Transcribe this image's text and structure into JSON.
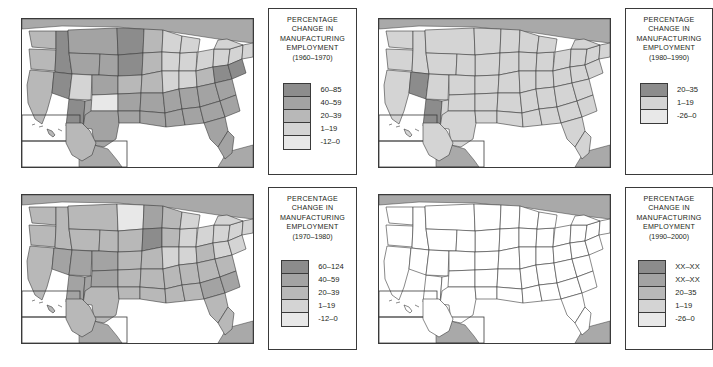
{
  "figure": {
    "caption": "",
    "panel_count": 4
  },
  "palette": {
    "ink": "#3a3a3a",
    "text": "#231f20",
    "background": "#ffffff",
    "canada_mexico_fill": "#a9a9a9",
    "water_fill": "#ffffff",
    "tone_1_darkest": "#8c8c8c",
    "tone_2": "#a3a3a3",
    "tone_3": "#b8b8b8",
    "tone_4": "#d4d4d4",
    "tone_5_lightest": "#e8e8e8",
    "unfilled": "#ffffff"
  },
  "legend_common": {
    "line1": "PERCENTAGE",
    "line2": "CHANGE IN",
    "line3": "MANUFACTURING",
    "line4": "EMPLOYMENT"
  },
  "panels": [
    {
      "id": "panel-1960-1970",
      "position": "top-left",
      "period": "(1960–1970)",
      "legend": {
        "classes": [
          {
            "label": "60–85",
            "color": "#8c8c8c"
          },
          {
            "label": "40–59",
            "color": "#a3a3a3"
          },
          {
            "label": "20–39",
            "color": "#b8b8b8"
          },
          {
            "label": "1–19",
            "color": "#d4d4d4"
          },
          {
            "label": "-12–0",
            "color": "#e8e8e8"
          }
        ]
      }
    },
    {
      "id": "panel-1980-1990",
      "position": "top-right",
      "period": "(1980–1990)",
      "legend": {
        "classes": [
          {
            "label": "20–35",
            "color": "#8c8c8c"
          },
          {
            "label": "1–19",
            "color": "#d4d4d4"
          },
          {
            "label": "-26–0",
            "color": "#e8e8e8"
          }
        ]
      }
    },
    {
      "id": "panel-1970-1980",
      "position": "bottom-left",
      "period": "(1970–1980)",
      "legend": {
        "classes": [
          {
            "label": "60–124",
            "color": "#8c8c8c"
          },
          {
            "label": "40–59",
            "color": "#a3a3a3"
          },
          {
            "label": "20–39",
            "color": "#b8b8b8"
          },
          {
            "label": "1–19",
            "color": "#d4d4d4"
          },
          {
            "label": "-12–0",
            "color": "#e8e8e8"
          }
        ]
      }
    },
    {
      "id": "panel-1990-2000",
      "position": "bottom-right",
      "period": "(1990–2000)",
      "legend": {
        "classes": [
          {
            "label": "XX–XX",
            "color": "#8c8c8c"
          },
          {
            "label": "XX–XX",
            "color": "#a3a3a3"
          },
          {
            "label": "20–35",
            "color": "#b8b8b8"
          },
          {
            "label": "1–19",
            "color": "#d4d4d4"
          },
          {
            "label": "-26–0",
            "color": "#e8e8e8"
          }
        ]
      }
    }
  ],
  "map_data": {
    "type": "choropleth-series",
    "subject": "Percentage change in manufacturing employment by state",
    "units": "percent",
    "panel_1960_1970": {
      "tone_1_darkest_states": [
        "AZ",
        "NV",
        "VA",
        "MD",
        "ND",
        "SD"
      ],
      "tone_2_states": [
        "UT",
        "CO",
        "NM",
        "TX",
        "OK",
        "KS_S",
        "AR",
        "LA",
        "MS",
        "AL",
        "GA",
        "SC",
        "NC",
        "TN",
        "KY",
        "FL",
        "MT",
        "WY",
        "ID",
        "NE"
      ],
      "tone_3_states": [
        "CA",
        "OR",
        "WA",
        "MN",
        "IA",
        "MO",
        "WV",
        "DE",
        "NJ"
      ],
      "tone_4_states": [
        "IL",
        "IN",
        "OH",
        "MI",
        "WI",
        "PA",
        "NY",
        "VT",
        "NH",
        "ME",
        "MA",
        "CT",
        "RI"
      ],
      "tone_5_lightest_states": [
        "KS",
        "AK",
        "HI"
      ]
    },
    "panel_1980_1990": {
      "tone_1_darkest_states": [
        "NV",
        "AZ"
      ],
      "tone_4_states": [
        "CA",
        "OR",
        "WA",
        "ID",
        "MT",
        "WY",
        "UT",
        "CO",
        "NM",
        "TX",
        "OK",
        "KS",
        "NE",
        "SD",
        "ND",
        "MN",
        "IA",
        "MO",
        "AR",
        "LA",
        "MS",
        "AL",
        "GA",
        "SC",
        "NC",
        "TN",
        "KY",
        "FL",
        "WI",
        "MI",
        "IL",
        "IN",
        "OH",
        "WV",
        "VA",
        "MD",
        "DE",
        "NJ",
        "PA",
        "NY",
        "VT",
        "NH",
        "ME",
        "MA",
        "CT",
        "RI",
        "AK",
        "HI"
      ]
    },
    "panel_1970_1980": {
      "tone_1_darkest_states": [
        "SD"
      ],
      "tone_2_states": [
        "NV",
        "UT",
        "AZ",
        "NM",
        "ND",
        "SC",
        "ID",
        "CO"
      ],
      "tone_3_states": [
        "WA",
        "OR",
        "CA",
        "MT",
        "WY",
        "TX",
        "OK",
        "KS",
        "NE",
        "AR",
        "LA",
        "MS",
        "AL",
        "GA",
        "FL",
        "TN",
        "NC",
        "VA",
        "WV",
        "KY",
        "MO",
        "IA",
        "MN",
        "WI",
        "AK",
        "HI"
      ],
      "tone_4_states": [
        "IL",
        "IN",
        "OH",
        "MI",
        "PA",
        "NY",
        "MD",
        "DE",
        "NJ",
        "VT",
        "NH",
        "ME",
        "MA",
        "CT",
        "RI"
      ],
      "tone_5_lightest_states": [
        "MT_N"
      ]
    },
    "panel_1990_2000": {
      "note": "all states unfilled / blank template",
      "tone_1_darkest_states": [],
      "unfilled_states": "all"
    }
  }
}
